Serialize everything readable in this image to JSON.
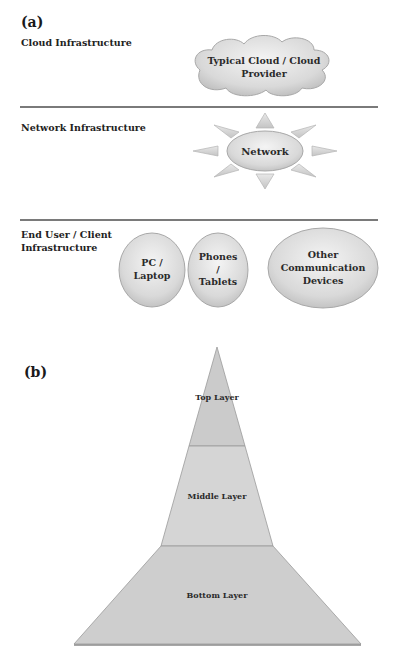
{
  "panel_a": {
    "label": "(a)",
    "rows": [
      {
        "label": "Cloud Infrastructure",
        "shape": "cloud",
        "node": {
          "line1": "Typical Cloud / Cloud",
          "line2": "Provider"
        }
      },
      {
        "label": "Network Infrastructure",
        "shape": "sun",
        "node": {
          "line1": "Network"
        }
      },
      {
        "label_line1": "End User / Client",
        "label_line2": "Infrastructure",
        "shape": "ellipses",
        "nodes": [
          {
            "line1": "PC /",
            "line2": "Laptop"
          },
          {
            "line1": "Phones",
            "line2": "/",
            "line3": "Tablets"
          },
          {
            "line1": "Other",
            "line2": "Communication",
            "line3": "Devices"
          }
        ]
      }
    ]
  },
  "panel_b": {
    "label": "(b)",
    "shape": "pyramid",
    "layers": [
      {
        "name": "Top Layer",
        "color": "#c9c9c9"
      },
      {
        "name": "Middle Layer",
        "color": "#d4d4d4"
      },
      {
        "name": "Bottom Layer",
        "color": "#cdcdcd"
      }
    ]
  },
  "colors": {
    "separator": "#7a7a7a",
    "shape_fill_light": "#efefef",
    "shape_fill_dark": "#bdbdbd",
    "shape_stroke": "#a8a8a8"
  }
}
